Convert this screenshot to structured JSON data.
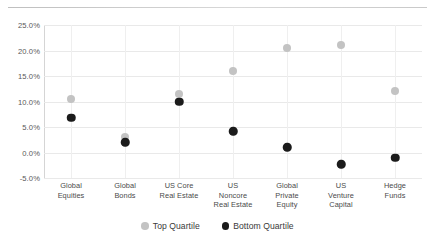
{
  "chart_data": {
    "type": "scatter",
    "title": "",
    "subtitle": "",
    "xlabel": "",
    "ylabel": "",
    "ylim": [
      -5.0,
      25.0
    ],
    "ytick_values": [
      25.0,
      20.0,
      15.0,
      10.0,
      5.0,
      0.0,
      -5.0
    ],
    "ytick_labels": [
      "25.0%",
      "20.0%",
      "15.0%",
      "10.0%",
      "5.0%",
      "0.0%",
      "-5.0%"
    ],
    "grid": true,
    "legend_position": "bottom-center",
    "categories": [
      "Global\nEquities",
      "Global\nBonds",
      "US Core\nReal Estate",
      "US\nNoncore\nReal Estate",
      "Global\nPrivate\nEquity",
      "US\nVenture\nCapital",
      "Hedge\nFunds"
    ],
    "series": [
      {
        "name": "Top Quartile",
        "color": "#c3c3c3",
        "values": [
          10.5,
          3.0,
          11.5,
          16.0,
          20.4,
          21.0,
          12.0
        ]
      },
      {
        "name": "Bottom Quartile",
        "color": "#1b1b1b",
        "values": [
          6.8,
          2.0,
          10.0,
          4.2,
          1.0,
          -2.3,
          -1.0
        ]
      }
    ]
  },
  "legend": {
    "items": [
      {
        "label": "Top Quartile",
        "swatch": "top"
      },
      {
        "label": "Bottom Quartile",
        "swatch": "bottom"
      }
    ]
  }
}
